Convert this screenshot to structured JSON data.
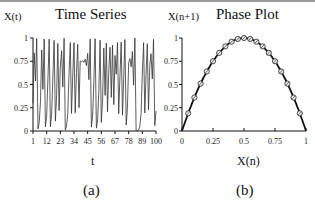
{
  "chart_data": [
    {
      "type": "line",
      "title": "Time Series",
      "xlabel": "t",
      "ylabel": "X(t)",
      "caption": "(a)",
      "x_ticks": [
        "1",
        "12",
        "23",
        "34",
        "45",
        "56",
        "67",
        "78",
        "89",
        "100"
      ],
      "y_ticks": [
        "0",
        "0.25",
        "0.5",
        "0.75",
        "1"
      ],
      "xlim": [
        1,
        100
      ],
      "ylim": [
        0,
        1
      ],
      "grid": false,
      "series": [
        {
          "name": "X(t)",
          "generator": "logistic map r=4",
          "x0": 0.3,
          "n": 100
        }
      ]
    },
    {
      "type": "scatter",
      "title": "Phase Plot",
      "xlabel": "X(n)",
      "ylabel": "X(n+1)",
      "caption": "(b)",
      "x_ticks": [
        "0",
        "0.25",
        "0.5",
        "0.75",
        "1"
      ],
      "y_ticks": [
        "0",
        "0.25",
        "0.5",
        "0.75",
        "1"
      ],
      "xlim": [
        0,
        1
      ],
      "ylim": [
        0,
        1
      ],
      "grid": false,
      "curve": "X(n+1) = 4 X(n) (1 - X(n))",
      "points_x": [
        0.05,
        0.1,
        0.15,
        0.2,
        0.25,
        0.3,
        0.35,
        0.4,
        0.45,
        0.5,
        0.55,
        0.6,
        0.65,
        0.7,
        0.75,
        0.8,
        0.85,
        0.9,
        0.95
      ],
      "points_y": [
        0.19,
        0.36,
        0.51,
        0.64,
        0.75,
        0.84,
        0.91,
        0.96,
        0.99,
        1.0,
        0.99,
        0.96,
        0.91,
        0.84,
        0.75,
        0.64,
        0.51,
        0.36,
        0.19
      ]
    }
  ]
}
